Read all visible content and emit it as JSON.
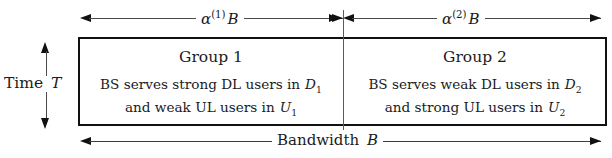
{
  "figure": {
    "type": "block-diagram",
    "caption_absent": true,
    "dimensions": {
      "top_left": {
        "label_plain": "alpha^(1) B",
        "symbol": "α",
        "superscript": "(1)",
        "quantity": "B",
        "direction": "double-arrow",
        "meaning": "bandwidth fraction allocated to Group 1"
      },
      "top_right": {
        "label_plain": "alpha^(2) B",
        "symbol": "α",
        "superscript": "(2)",
        "quantity": "B",
        "direction": "double-arrow",
        "meaning": "bandwidth fraction allocated to Group 2"
      },
      "bottom": {
        "label_plain": "Bandwidth B",
        "text": "Bandwidth",
        "quantity": "B",
        "direction": "double-arrow",
        "meaning": "total system bandwidth"
      },
      "left": {
        "label_plain": "Time T",
        "text": "Time",
        "quantity": "T",
        "direction": "double-arrow-vertical",
        "meaning": "total frame duration"
      }
    },
    "blocks": [
      {
        "id": "group-1",
        "title": "Group 1",
        "lines": [
          {
            "prefix": "BS serves strong DL users in",
            "set_symbol": "D",
            "set_subscript": "1",
            "plain": "BS serves strong DL users in D_1"
          },
          {
            "prefix": "and weak UL users in",
            "set_symbol": "U",
            "set_subscript": "1",
            "plain": "and weak UL users in U_1"
          }
        ]
      },
      {
        "id": "group-2",
        "title": "Group 2",
        "lines": [
          {
            "prefix": "BS serves weak DL users in",
            "set_symbol": "D",
            "set_subscript": "2",
            "plain": "BS serves weak DL users in D_2"
          },
          {
            "prefix": "and strong UL users in",
            "set_symbol": "U",
            "set_subscript": "2",
            "plain": "and strong UL users in U_2"
          }
        ]
      }
    ],
    "colors": {
      "box_border": "#111111",
      "divider": "#5b5b5b",
      "dimension_line": "#4a4a4a",
      "text": "#1b1b1b",
      "background": "#ffffff"
    }
  }
}
